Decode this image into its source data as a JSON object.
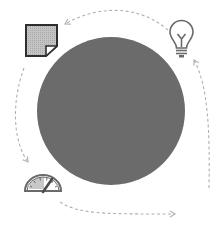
{
  "diagram": {
    "title": "Cycle diagram",
    "type": "cycle",
    "center": {
      "shape": "circle",
      "label": "",
      "color": "#6b6b6b"
    },
    "nodes": [
      {
        "id": "document",
        "icon": "folded-page-icon",
        "position": "top-left"
      },
      {
        "id": "idea",
        "icon": "lightbulb-icon",
        "position": "top-right"
      },
      {
        "id": "performance",
        "icon": "speedometer-gauge-icon",
        "position": "bottom-left"
      }
    ],
    "flow": [
      {
        "from": "idea",
        "to": "document",
        "style": "dashed-arrow"
      },
      {
        "from": "document",
        "to": "performance",
        "style": "dashed-arrow"
      },
      {
        "from": "performance",
        "to": "bottom-right-exit",
        "style": "dashed-arrow"
      },
      {
        "from": "right-side-entry",
        "to": "idea",
        "style": "dashed-arrow"
      }
    ],
    "colors": {
      "circle": "#6b6b6b",
      "icon_stroke": "#5a5a5a",
      "icon_fill": "#bdbdbd",
      "arrow": "#b5b5b5",
      "background": "#ffffff"
    }
  }
}
